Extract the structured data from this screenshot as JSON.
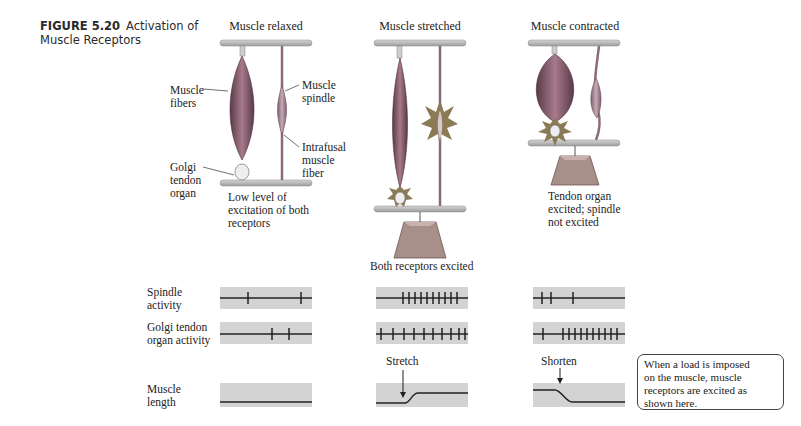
{
  "figure": {
    "number": "FIGURE 5.20",
    "title_line1": "Activation of",
    "title_line2": "Muscle Receptors"
  },
  "panels": {
    "relaxed": {
      "title": "Muscle relaxed",
      "labels": {
        "muscle_fibers": [
          "Muscle",
          "fibers"
        ],
        "muscle_spindle": [
          "Muscle",
          "spindle"
        ],
        "intrafusal": [
          "Intrafusal",
          "muscle",
          "fiber"
        ],
        "golgi": [
          "Golgi",
          "tendon",
          "organ"
        ]
      },
      "caption": [
        "Low level of",
        "excitation of both",
        "receptors"
      ]
    },
    "stretched": {
      "title": "Muscle stretched",
      "caption": "Both receptors excited"
    },
    "contracted": {
      "title": "Muscle contracted",
      "caption": [
        "Tendon organ",
        "excited; spindle",
        "not excited"
      ]
    }
  },
  "traces": {
    "row_labels": {
      "spindle": [
        "Spindle",
        "activity"
      ],
      "golgi": [
        "Golgi tendon",
        "organ activity"
      ],
      "length": [
        "Muscle",
        "length"
      ]
    },
    "annotations": {
      "stretch": "Stretch",
      "shorten": "Shorten"
    }
  },
  "callout": {
    "text": [
      "When a load is imposed",
      "on the muscle, muscle",
      "receptors are excited as",
      "shown here."
    ]
  },
  "colors": {
    "trace_bg": "#d3d3d3",
    "bar": "#b8b8b8",
    "muscle": "#8a5a6e",
    "weight": "#a98f8a",
    "burst": "#8a7a55"
  }
}
